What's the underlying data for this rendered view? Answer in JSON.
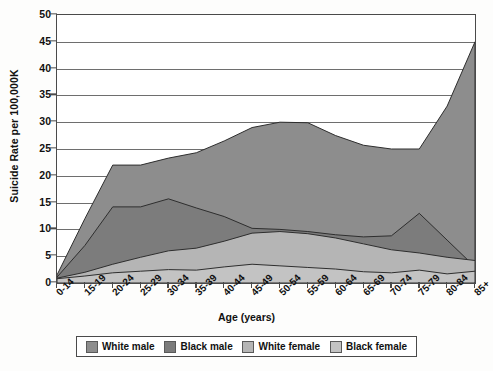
{
  "chart_data": {
    "type": "area",
    "title": "",
    "xlabel": "Age (years)",
    "ylabel": "Suicide Rate per 100,000K",
    "categories": [
      "0-14",
      "15-19",
      "20-24",
      "25-29",
      "30-34",
      "35-39",
      "40-44",
      "45-49",
      "50-54",
      "55-59",
      "60-64",
      "65-69",
      "70-74",
      "75-79",
      "80-84",
      "85+"
    ],
    "ylim": [
      0,
      50
    ],
    "ytick_step": 5,
    "yticks": [
      0,
      5,
      10,
      15,
      20,
      25,
      30,
      35,
      40,
      45,
      50
    ],
    "grid": true,
    "legend_position": "bottom",
    "series": [
      {
        "name": "White male",
        "color": "#8d8d8d",
        "values": [
          1.5,
          12.0,
          22.0,
          22.0,
          23.3,
          24.3,
          26.5,
          29.0,
          30.0,
          29.9,
          27.5,
          25.7,
          25.0,
          25.0,
          33.0,
          45.0
        ]
      },
      {
        "name": "Black male",
        "color": "#7c7c7c",
        "values": [
          1.1,
          7.0,
          14.2,
          14.2,
          15.7,
          14.0,
          12.4,
          10.2,
          10.0,
          9.6,
          9.0,
          8.6,
          8.8,
          13.0,
          8.0,
          3.0
        ]
      },
      {
        "name": "White female",
        "color": "#b5b5b5",
        "values": [
          0.9,
          2.0,
          3.5,
          4.8,
          6.0,
          6.5,
          7.8,
          9.3,
          9.6,
          9.2,
          8.4,
          7.3,
          6.2,
          5.6,
          4.8,
          4.2
        ]
      },
      {
        "name": "Black female",
        "color": "#c3c3c3",
        "values": [
          0.8,
          1.3,
          1.9,
          2.2,
          2.5,
          2.4,
          3.0,
          3.5,
          3.2,
          2.9,
          2.6,
          2.1,
          1.9,
          2.4,
          1.7,
          2.2
        ]
      }
    ]
  },
  "legend": {
    "items": [
      {
        "label": "White male"
      },
      {
        "label": "Black male"
      },
      {
        "label": "White female"
      },
      {
        "label": "Black female"
      }
    ]
  },
  "axes": {
    "y_title": "Suicide Rate per 100,000K",
    "x_title": "Age (years)"
  }
}
